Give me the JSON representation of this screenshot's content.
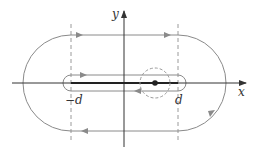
{
  "diagram": {
    "type": "contour-integration-path",
    "axes": {
      "x_label": "x",
      "y_label": "y"
    },
    "markers": {
      "left_label": "−d",
      "right_label": "d"
    },
    "elements": [
      "outer stadium contour with arrows (counter-clockwise)",
      "inner stadium contour around segment [-d, d]",
      "thick segment on x-axis from -d to d",
      "dashed vertical lines at x = -d and x = d",
      "point on segment with dashed circle around it"
    ],
    "colors": {
      "axis": "#333333",
      "contour": "#8a8a8a",
      "dashed": "#9a9a9a",
      "segment": "#222222",
      "point": "#222222"
    }
  }
}
